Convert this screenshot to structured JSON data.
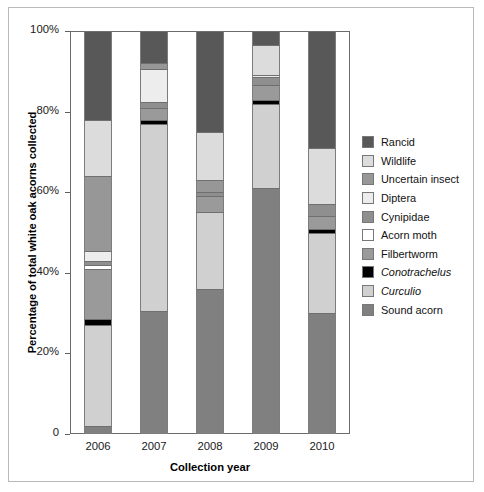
{
  "chart_data": {
    "type": "bar",
    "subtype": "stacked-bar-100-percent",
    "title": "",
    "xlabel": "Collection year",
    "ylabel": "Percentage of total white oak acorns collected",
    "categories": [
      "2006",
      "2007",
      "2008",
      "2009",
      "2010"
    ],
    "ylim": [
      0,
      100
    ],
    "yticks": [
      0,
      20,
      40,
      60,
      80,
      100
    ],
    "ytick_labels": [
      "0",
      "20%",
      "40%",
      "60%",
      "80%",
      "100%"
    ],
    "grid": false,
    "legend_position": "right",
    "stack_order_bottom_to_top": [
      "Sound acorn",
      "Curculio",
      "Conotrachelus",
      "Filbertworm",
      "Acorn moth",
      "Cynipidae",
      "Diptera",
      "Uncertain insect",
      "Wildlife",
      "Rancid"
    ],
    "series": [
      {
        "name": "Sound acorn",
        "color": "#808080",
        "italic": false,
        "values": [
          2.0,
          30.5,
          36.0,
          61.0,
          30.0
        ]
      },
      {
        "name": "Curculio",
        "color": "#d0d0d0",
        "italic": true,
        "values": [
          25.0,
          46.5,
          19.0,
          21.0,
          20.0
        ]
      },
      {
        "name": "Conotrachelus",
        "color": "#000000",
        "italic": true,
        "values": [
          1.5,
          1.0,
          0.0,
          1.0,
          1.0
        ]
      },
      {
        "name": "Filbertworm",
        "color": "#9a9a9a",
        "italic": false,
        "values": [
          12.5,
          3.0,
          4.0,
          3.5,
          3.0
        ]
      },
      {
        "name": "Acorn moth",
        "color": "#ffffff",
        "italic": false,
        "values": [
          1.0,
          0.0,
          0.0,
          0.0,
          0.0
        ]
      },
      {
        "name": "Cynipidae",
        "color": "#8f8f8f",
        "italic": false,
        "values": [
          1.0,
          1.5,
          1.0,
          2.0,
          3.0
        ]
      },
      {
        "name": "Diptera",
        "color": "#ededed",
        "italic": false,
        "values": [
          2.5,
          8.0,
          0.0,
          0.5,
          0.0
        ]
      },
      {
        "name": "Uncertain insect",
        "color": "#979797",
        "italic": false,
        "values": [
          18.5,
          1.5,
          3.0,
          0.0,
          0.0
        ]
      },
      {
        "name": "Wildlife",
        "color": "#dcdcdc",
        "italic": false,
        "values": [
          14.0,
          0.0,
          12.0,
          7.5,
          14.0
        ]
      },
      {
        "name": "Rancid",
        "color": "#585858",
        "italic": false,
        "values": [
          22.0,
          8.0,
          25.0,
          3.5,
          29.0
        ]
      }
    ],
    "legend_entries": [
      {
        "label": "Rancid",
        "color": "#585858",
        "italic": false
      },
      {
        "label": "Wildlife",
        "color": "#dcdcdc",
        "italic": false
      },
      {
        "label": "Uncertain insect",
        "color": "#979797",
        "italic": false
      },
      {
        "label": "Diptera",
        "color": "#ededed",
        "italic": false
      },
      {
        "label": "Cynipidae",
        "color": "#8f8f8f",
        "italic": false
      },
      {
        "label": "Acorn moth",
        "color": "#ffffff",
        "italic": false
      },
      {
        "label": "Filbertworm",
        "color": "#9a9a9a",
        "italic": false
      },
      {
        "label": "Conotrachelus",
        "color": "#000000",
        "italic": true
      },
      {
        "label": "Curculio",
        "color": "#d0d0d0",
        "italic": true
      },
      {
        "label": "Sound acorn",
        "color": "#808080",
        "italic": false
      }
    ]
  }
}
